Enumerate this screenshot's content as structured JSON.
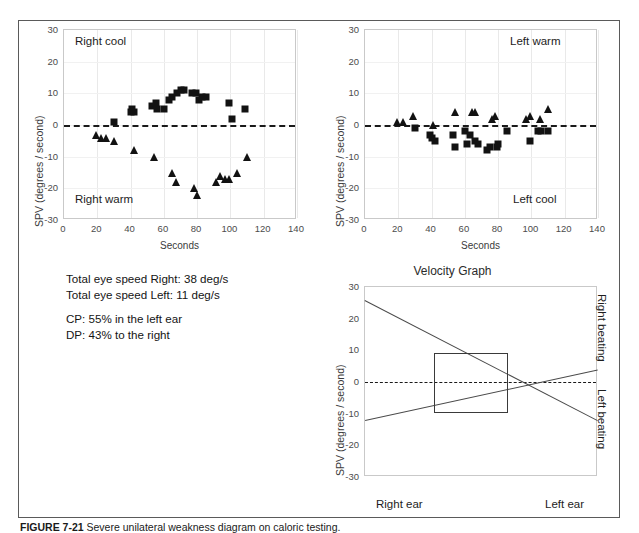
{
  "figure": {
    "caption_label": "FIGURE 7-21",
    "caption_text": "Severe unilateral weakness diagram on caloric testing."
  },
  "panels": {
    "right_ear": {
      "name": "Right ear caloric scatter",
      "top_label": "Right cool",
      "bottom_label": "Right warm",
      "xlabel": "Seconds",
      "ylabel": "SPV (degrees / second)"
    },
    "left_ear": {
      "name": "Left ear caloric scatter",
      "top_label": "Left warm",
      "bottom_label": "Left cool",
      "xlabel": "Seconds",
      "ylabel": "SPV (degrees / second)"
    },
    "velocity": {
      "title": "Velocity Graph",
      "ylabel": "SPV (degrees / second)",
      "x_left_label": "Right ear",
      "x_right_label": "Left ear",
      "side_top_label": "Right beating",
      "side_bottom_label": "Left beating"
    }
  },
  "summary": {
    "line1": "Total eye speed Right: 38 deg/s",
    "line2": "Total eye speed Left: 11 deg/s",
    "line3": "CP: 55% in the left ear",
    "line4": "DP: 43% to the right"
  },
  "chart_data": [
    {
      "type": "scatter",
      "id": "right-ear-caloric",
      "title": "",
      "xlabel": "Seconds",
      "ylabel": "SPV (degrees / second)",
      "xlim": [
        0,
        140
      ],
      "ylim": [
        -30,
        30
      ],
      "xticks": [
        0,
        20,
        40,
        60,
        80,
        100,
        120,
        140
      ],
      "yticks": [
        30,
        20,
        10,
        0,
        -10,
        -20,
        -30
      ],
      "grid": true,
      "zero_reference_line": 0,
      "annotations": [
        {
          "text": "Right cool",
          "x": 12,
          "y": 26
        },
        {
          "text": "Right warm",
          "x": 12,
          "y": -25
        }
      ],
      "series": [
        {
          "name": "Right cool (squares)",
          "marker": "square",
          "points": [
            [
              30,
              1
            ],
            [
              40,
              4
            ],
            [
              41,
              5
            ],
            [
              42,
              4
            ],
            [
              53,
              6
            ],
            [
              55,
              7
            ],
            [
              56,
              5
            ],
            [
              60,
              5
            ],
            [
              63,
              8
            ],
            [
              65,
              9
            ],
            [
              68,
              10
            ],
            [
              70,
              11
            ],
            [
              72,
              11
            ],
            [
              77,
              10
            ],
            [
              79,
              10
            ],
            [
              81,
              8
            ],
            [
              83,
              9
            ],
            [
              85,
              9
            ],
            [
              99,
              7
            ],
            [
              101,
              2
            ],
            [
              109,
              5
            ]
          ]
        },
        {
          "name": "Right warm (triangles)",
          "marker": "triangle",
          "points": [
            [
              19,
              -3
            ],
            [
              22,
              -4
            ],
            [
              25,
              -4
            ],
            [
              30,
              -5
            ],
            [
              42,
              -8
            ],
            [
              54,
              -10
            ],
            [
              65,
              -15
            ],
            [
              67,
              -18
            ],
            [
              78,
              -20
            ],
            [
              80,
              -22
            ],
            [
              91,
              -18
            ],
            [
              94,
              -16
            ],
            [
              97,
              -17
            ],
            [
              99,
              -17
            ],
            [
              104,
              -15
            ],
            [
              110,
              -10
            ]
          ]
        }
      ]
    },
    {
      "type": "scatter",
      "id": "left-ear-caloric",
      "title": "",
      "xlabel": "Seconds",
      "ylabel": "SPV (degrees / second)",
      "xlim": [
        0,
        140
      ],
      "ylim": [
        -30,
        30
      ],
      "xticks": [
        0,
        20,
        40,
        60,
        80,
        100,
        120,
        140
      ],
      "yticks": [
        30,
        20,
        10,
        0,
        -10,
        -20,
        -30
      ],
      "grid": true,
      "zero_reference_line": 0,
      "annotations": [
        {
          "text": "Left warm",
          "x": 128,
          "y": 26
        },
        {
          "text": "Left cool",
          "x": 128,
          "y": -25
        }
      ],
      "series": [
        {
          "name": "Left cool (squares)",
          "marker": "square",
          "points": [
            [
              30,
              -1
            ],
            [
              39,
              -3
            ],
            [
              40,
              -4
            ],
            [
              42,
              -5
            ],
            [
              53,
              -3
            ],
            [
              54,
              -7
            ],
            [
              60,
              -2
            ],
            [
              61,
              -6
            ],
            [
              63,
              -3
            ],
            [
              66,
              -5
            ],
            [
              68,
              -6
            ],
            [
              73,
              -8
            ],
            [
              75,
              -7
            ],
            [
              79,
              -7
            ],
            [
              80,
              -6
            ],
            [
              85,
              -2
            ],
            [
              99,
              -5
            ],
            [
              104,
              -2
            ],
            [
              106,
              -2
            ],
            [
              110,
              -2
            ]
          ]
        },
        {
          "name": "Left warm (triangles)",
          "marker": "triangle",
          "points": [
            [
              19,
              1
            ],
            [
              23,
              1
            ],
            [
              29,
              3
            ],
            [
              41,
              0
            ],
            [
              54,
              4
            ],
            [
              64,
              4
            ],
            [
              66,
              4
            ],
            [
              76,
              2
            ],
            [
              78,
              3
            ],
            [
              97,
              2
            ],
            [
              99,
              3
            ],
            [
              105,
              2
            ],
            [
              110,
              5
            ]
          ]
        }
      ]
    },
    {
      "type": "line",
      "id": "velocity-graph",
      "title": "Velocity Graph",
      "xlabel": "",
      "ylabel": "SPV (degrees / second)",
      "xlim": [
        0,
        100
      ],
      "ylim": [
        -30,
        30
      ],
      "yticks": [
        30,
        20,
        10,
        0,
        -10,
        -20,
        -30
      ],
      "x_category_labels": [
        "Right ear",
        "Left ear"
      ],
      "side_labels": [
        "Right beating",
        "Left beating"
      ],
      "grid": false,
      "zero_reference_line": 0,
      "series": [
        {
          "name": "Right beating response",
          "points": [
            [
              0,
              26
            ],
            [
              100,
              -12
            ]
          ]
        },
        {
          "name": "Left beating response",
          "points": [
            [
              0,
              -12
            ],
            [
              100,
              4
            ]
          ]
        }
      ],
      "normal_range_box": {
        "x0": 30,
        "x1": 62,
        "y0": -10,
        "y1": 9
      }
    }
  ]
}
